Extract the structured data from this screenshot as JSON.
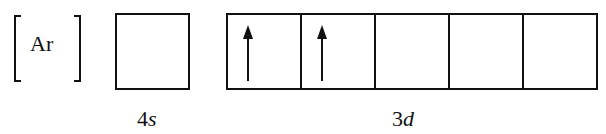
{
  "core": {
    "label": "Ar"
  },
  "orbitals": [
    {
      "name": "4s",
      "n": "4",
      "l": "s",
      "boxes": [
        {
          "electrons": []
        }
      ]
    },
    {
      "name": "3d",
      "n": "3",
      "l": "d",
      "boxes": [
        {
          "electrons": [
            "up"
          ]
        },
        {
          "electrons": [
            "up"
          ]
        },
        {
          "electrons": []
        },
        {
          "electrons": []
        },
        {
          "electrons": []
        }
      ]
    }
  ]
}
